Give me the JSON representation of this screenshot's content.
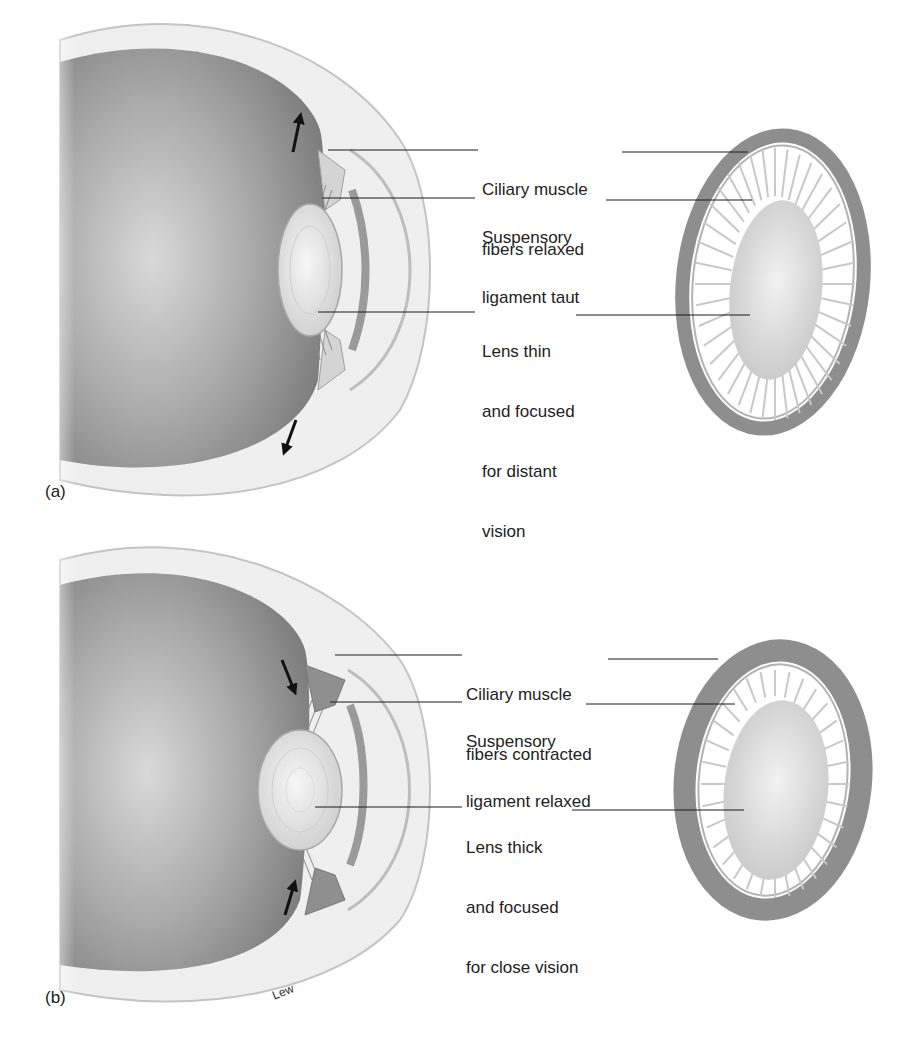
{
  "figure": {
    "panels": [
      {
        "id": "a",
        "letter": "(a)",
        "state": "distant vision",
        "labels": [
          {
            "key": "ciliary",
            "line1": "Ciliary muscle",
            "line2": "fibers relaxed"
          },
          {
            "key": "suspensory",
            "line1": "Suspensory",
            "line2": "ligament taut"
          },
          {
            "key": "lens",
            "line1": "Lens thin",
            "line2": "and focused",
            "line3": "for distant",
            "line4": "vision"
          }
        ]
      },
      {
        "id": "b",
        "letter": "(b)",
        "state": "close vision",
        "labels": [
          {
            "key": "ciliary",
            "line1": "Ciliary muscle",
            "line2": "fibers contracted"
          },
          {
            "key": "suspensory",
            "line1": "Suspensory",
            "line2": "ligament relaxed"
          },
          {
            "key": "lens",
            "line1": "Lens thick",
            "line2": "and focused",
            "line3": "for close vision"
          }
        ]
      }
    ],
    "signature": "Lew",
    "colors": {
      "vitreous": "#8a8a8a",
      "sclera": "#e8e8e8",
      "ring": "#8c8c8c",
      "lens": "#dedede",
      "leader": "#1a1a1a",
      "arrow": "#111111"
    }
  }
}
